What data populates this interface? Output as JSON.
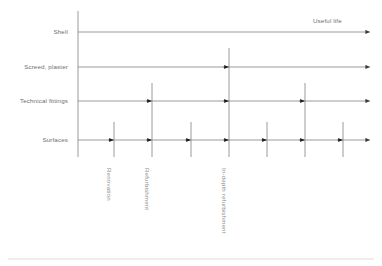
{
  "figure": {
    "axis_label": "Useful life",
    "line_color": "#8f8f8f",
    "text_color": "#6e6e6e",
    "rotated_text_color": "#8c8c8c",
    "rule_color": "#d3d3d3"
  },
  "rows": [
    {
      "label": "Shell",
      "y": 32,
      "marker_xs": []
    },
    {
      "label": "Screed, plaster",
      "y": 67,
      "marker_xs": [
        229
      ]
    },
    {
      "label": "Technical fittings",
      "y": 101,
      "marker_xs": [
        152,
        229,
        305
      ]
    },
    {
      "label": "Surfaces",
      "y": 140,
      "marker_xs": [
        114,
        152,
        191,
        229,
        267,
        305,
        343
      ]
    }
  ],
  "interventions": [
    {
      "name": "Renovation",
      "x": 114,
      "top": 122,
      "bottom": 157,
      "tier": "renovation"
    },
    {
      "name": "Refurbishment",
      "x": 152,
      "top": 83,
      "bottom": 157,
      "tier": "refurbishment"
    },
    {
      "name": "Renovation",
      "x": 191,
      "top": 122,
      "bottom": 157,
      "tier": "renovation"
    },
    {
      "name": "In-depth refurbishment",
      "x": 229,
      "top": 48,
      "bottom": 157,
      "tier": "in-depth"
    },
    {
      "name": "Renovation",
      "x": 267,
      "top": 122,
      "bottom": 157,
      "tier": "renovation"
    },
    {
      "name": "Refurbishment",
      "x": 305,
      "top": 83,
      "bottom": 157,
      "tier": "refurbishment"
    },
    {
      "name": "Renovation",
      "x": 343,
      "top": 122,
      "bottom": 157,
      "tier": "renovation"
    }
  ],
  "intervention_labels": [
    {
      "text": "Renovation",
      "x": 112,
      "y": 168
    },
    {
      "text": "Refurbishment",
      "x": 150,
      "y": 168
    },
    {
      "text": "In-depth refurbishment",
      "x": 227,
      "y": 168
    }
  ],
  "geometry": {
    "axis_x": 78,
    "axis_top": 11,
    "axis_bottom": 157,
    "arrow_end_x": 370,
    "label_right_x": 68,
    "useful_life_x": 313,
    "useful_life_y": 18,
    "rule_y": 259,
    "rule_x1": 8,
    "rule_x2": 374
  }
}
